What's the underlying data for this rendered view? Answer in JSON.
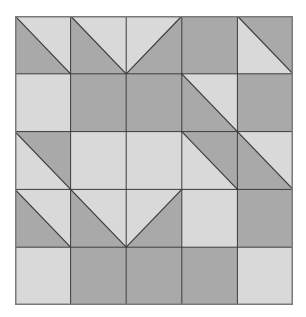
{
  "colors": {
    "light": "#d9d9d9",
    "dark": "#a9a9a9",
    "line": "#3a3a3a",
    "border": "#7a7a7a"
  },
  "grid": {
    "rows": 5,
    "cols": 5,
    "width": 278,
    "height": 289
  },
  "cells": [
    [
      {
        "type": "diag",
        "dir": "tlbr",
        "a": "light",
        "b": "dark"
      },
      {
        "type": "diag",
        "dir": "tlbr",
        "a": "light",
        "b": "dark"
      },
      {
        "type": "diag",
        "dir": "trbl",
        "a": "light",
        "b": "dark"
      },
      {
        "type": "solid",
        "fill": "dark"
      },
      {
        "type": "diag",
        "dir": "tlbr",
        "a": "dark",
        "b": "light"
      }
    ],
    [
      {
        "type": "solid",
        "fill": "light"
      },
      {
        "type": "solid",
        "fill": "dark"
      },
      {
        "type": "solid",
        "fill": "dark"
      },
      {
        "type": "diag",
        "dir": "tlbr",
        "a": "light",
        "b": "dark"
      },
      {
        "type": "solid",
        "fill": "dark"
      }
    ],
    [
      {
        "type": "diag",
        "dir": "tlbr",
        "a": "dark",
        "b": "light"
      },
      {
        "type": "solid",
        "fill": "light"
      },
      {
        "type": "solid",
        "fill": "light"
      },
      {
        "type": "diag",
        "dir": "tlbr",
        "a": "dark",
        "b": "light"
      },
      {
        "type": "diag",
        "dir": "tlbr",
        "a": "light",
        "b": "dark"
      }
    ],
    [
      {
        "type": "diag",
        "dir": "tlbr",
        "a": "light",
        "b": "dark"
      },
      {
        "type": "diag",
        "dir": "tlbr",
        "a": "light",
        "b": "dark"
      },
      {
        "type": "diag",
        "dir": "trbl",
        "a": "light",
        "b": "dark"
      },
      {
        "type": "solid",
        "fill": "light"
      },
      {
        "type": "solid",
        "fill": "dark"
      }
    ],
    [
      {
        "type": "solid",
        "fill": "light"
      },
      {
        "type": "solid",
        "fill": "dark"
      },
      {
        "type": "solid",
        "fill": "dark"
      },
      {
        "type": "solid",
        "fill": "dark"
      },
      {
        "type": "solid",
        "fill": "light"
      }
    ]
  ]
}
